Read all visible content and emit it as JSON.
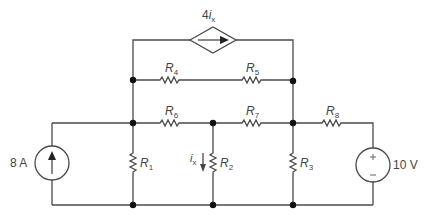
{
  "diagram": {
    "type": "circuit",
    "components": {
      "current_source": {
        "label": "8 A",
        "direction": "up"
      },
      "voltage_source": {
        "label": "10 V",
        "plus": "+",
        "minus": "−"
      },
      "dependent_source": {
        "label_coef": "4",
        "label_var": "i",
        "label_sub": "x",
        "type": "current-controlled current source",
        "direction": "right"
      },
      "resistors": [
        {
          "name": "R",
          "sub": "1"
        },
        {
          "name": "R",
          "sub": "2"
        },
        {
          "name": "R",
          "sub": "3"
        },
        {
          "name": "R",
          "sub": "4"
        },
        {
          "name": "R",
          "sub": "5"
        },
        {
          "name": "R",
          "sub": "6"
        },
        {
          "name": "R",
          "sub": "7"
        },
        {
          "name": "R",
          "sub": "8"
        }
      ],
      "current_label": {
        "var": "i",
        "sub": "x",
        "direction": "down"
      }
    },
    "colors": {
      "wire": "#4a4a4a",
      "node": "#111111",
      "text": "#444444"
    }
  }
}
